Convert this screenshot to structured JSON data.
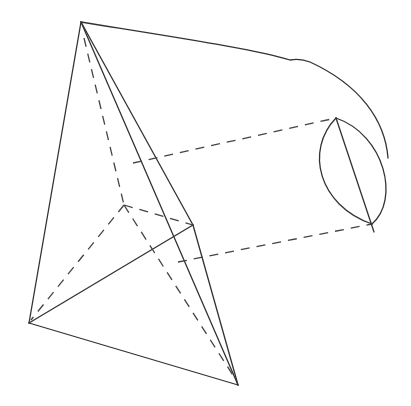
{
  "diagram": {
    "type": "geometry-3d-pyramid-with-projection",
    "stroke_color": "#333333",
    "background": "#ffffff",
    "points": {
      "apex": [
        81,
        22
      ],
      "left": [
        29,
        323
      ],
      "bottom": [
        238,
        385
      ],
      "right": [
        193,
        225
      ],
      "inner": [
        124,
        205
      ],
      "ellipse_top": [
        336,
        118
      ],
      "ellipse_bottom": [
        372,
        224
      ]
    }
  }
}
